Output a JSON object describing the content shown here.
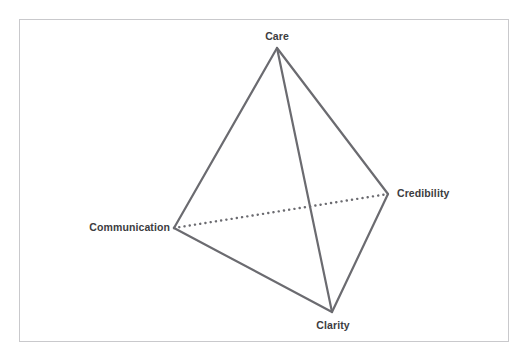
{
  "diagram": {
    "type": "tetrahedron-model",
    "background_color": "#ffffff",
    "frame": {
      "border_color": "#c9c9cc",
      "x": 19,
      "y": 19,
      "width": 490,
      "height": 323
    },
    "edge_color": "#6b6b70",
    "edge_width": 2.2,
    "hidden_edge_style": "dotted",
    "label_color": "#3c3c41",
    "vertices": [
      {
        "id": "care",
        "label": "Care",
        "x": 277,
        "y": 48
      },
      {
        "id": "credibility",
        "label": "Credibility",
        "x": 388,
        "y": 194
      },
      {
        "id": "clarity",
        "label": "Clarity",
        "x": 332,
        "y": 312
      },
      {
        "id": "communication",
        "label": "Communication",
        "x": 174,
        "y": 228
      }
    ],
    "edges": [
      {
        "from": "care",
        "to": "communication",
        "visible": true
      },
      {
        "from": "care",
        "to": "credibility",
        "visible": true
      },
      {
        "from": "care",
        "to": "clarity",
        "visible": true
      },
      {
        "from": "communication",
        "to": "clarity",
        "visible": true
      },
      {
        "from": "credibility",
        "to": "clarity",
        "visible": true
      },
      {
        "from": "communication",
        "to": "credibility",
        "visible": false
      }
    ]
  }
}
